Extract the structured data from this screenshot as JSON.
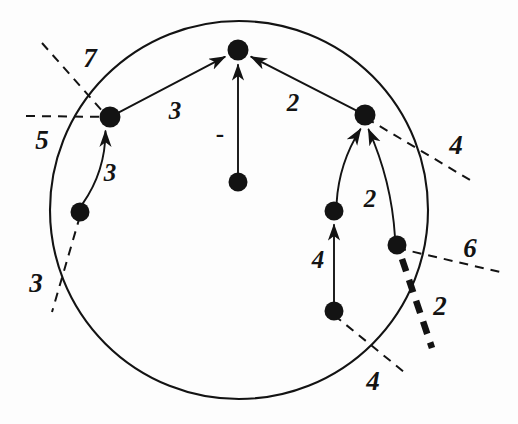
{
  "figure": {
    "type": "graph-diagram",
    "canvas": {
      "width": 518,
      "height": 424,
      "background": "#fdfdfd"
    },
    "ink_color": "#131313"
  },
  "boundary": {
    "shape": "circle",
    "name": "outer-circle",
    "cx": 239,
    "cy": 210,
    "r": 189,
    "stroke": "#131313",
    "stroke_width": 2.1,
    "fill": "none"
  },
  "nodes": [
    {
      "id": "n_top",
      "label": "top-node",
      "x": 238,
      "y": 50,
      "r": 10.5
    },
    {
      "id": "n_center",
      "label": "center-node",
      "x": 238,
      "y": 182,
      "r": 9.5
    },
    {
      "id": "n_left_up",
      "label": "left-upper-node",
      "x": 110,
      "y": 117,
      "r": 10.5
    },
    {
      "id": "n_left_low",
      "label": "left-lower-node",
      "x": 80,
      "y": 212,
      "r": 9.5
    },
    {
      "id": "n_right_up",
      "label": "right-upper-node",
      "x": 365,
      "y": 115,
      "r": 10.5
    },
    {
      "id": "n_right_mid",
      "label": "right-middle-node",
      "x": 334,
      "y": 211,
      "r": 9.5
    },
    {
      "id": "n_right_out",
      "label": "right-outer-node",
      "x": 397,
      "y": 245,
      "r": 9.5
    },
    {
      "id": "n_right_low",
      "label": "right-lower-node",
      "x": 334,
      "y": 311,
      "r": 9.5
    }
  ],
  "edges": [
    {
      "id": "e1",
      "name": "edge-left-upper-to-top",
      "from": "n_left_up",
      "to": "n_top",
      "weight": "3",
      "label_x": 175,
      "label_y": 110,
      "arrow": true,
      "curve": 0
    },
    {
      "id": "e2",
      "name": "edge-right-upper-to-top",
      "from": "n_right_up",
      "to": "n_top",
      "weight": "2",
      "label_x": 293,
      "label_y": 102,
      "arrow": true,
      "curve": 0
    },
    {
      "id": "e3",
      "name": "edge-center-to-top",
      "from": "n_center",
      "to": "n_top",
      "weight": "-",
      "label_x": 220,
      "label_y": 133,
      "arrow": true,
      "curve": 0
    },
    {
      "id": "e4",
      "name": "edge-left-lower-to-left-upper",
      "from": "n_left_low",
      "to": "n_left_up",
      "weight": "3",
      "label_x": 110,
      "label_y": 172,
      "arrow": true,
      "curve": 12
    },
    {
      "id": "e5",
      "name": "edge-right-middle-to-right-upper",
      "from": "n_right_mid",
      "to": "n_right_up",
      "weight": "",
      "label_x": 0,
      "label_y": 0,
      "arrow": true,
      "curve": -10
    },
    {
      "id": "e6",
      "name": "edge-right-outer-to-right-upper",
      "from": "n_right_out",
      "to": "n_right_up",
      "weight": "2",
      "label_x": 370,
      "label_y": 198,
      "arrow": true,
      "curve": 10
    },
    {
      "id": "e7",
      "name": "edge-right-lower-to-right-middle",
      "from": "n_right_low",
      "to": "n_right_mid",
      "weight": "4",
      "label_x": 318,
      "label_y": 259,
      "arrow": true,
      "curve": 0
    }
  ],
  "cut_lines": [
    {
      "id": "c_7",
      "name": "cut-line-7",
      "style": "dashed-thin",
      "x1": 42,
      "y1": 43,
      "x2": 112,
      "y2": 122,
      "weight": "7",
      "label_x": 90,
      "label_y": 58
    },
    {
      "id": "c_5",
      "name": "cut-line-5",
      "style": "dashed-thin",
      "x1": 26,
      "y1": 116,
      "x2": 112,
      "y2": 117,
      "weight": "5",
      "label_x": 42,
      "label_y": 140
    },
    {
      "id": "c_3",
      "name": "cut-line-3",
      "style": "dashed-thin",
      "x1": 80,
      "y1": 216,
      "x2": 52,
      "y2": 312,
      "weight": "3",
      "label_x": 36,
      "label_y": 283
    },
    {
      "id": "c_4_right",
      "name": "cut-line-4-right",
      "style": "dashed-thin",
      "x1": 366,
      "y1": 118,
      "x2": 470,
      "y2": 180,
      "weight": "4",
      "label_x": 456,
      "label_y": 145
    },
    {
      "id": "c_6",
      "name": "cut-line-6",
      "style": "dashed-thin",
      "x1": 397,
      "y1": 248,
      "x2": 500,
      "y2": 272,
      "weight": "6",
      "label_x": 470,
      "label_y": 248
    },
    {
      "id": "c_2_thick",
      "name": "cut-line-2-thick",
      "style": "dashed-thick",
      "x1": 402,
      "y1": 259,
      "x2": 432,
      "y2": 348,
      "weight": "2",
      "label_x": 440,
      "label_y": 306
    },
    {
      "id": "c_4_bottom",
      "name": "cut-line-4-bottom",
      "style": "dashed-thin",
      "x1": 334,
      "y1": 315,
      "x2": 404,
      "y2": 372,
      "weight": "4",
      "label_x": 373,
      "label_y": 381
    }
  ],
  "legend": {
    "edge_weights": [
      "3",
      "2",
      "-",
      "3",
      "2",
      "4"
    ],
    "cut_weights": [
      "7",
      "5",
      "3",
      "4",
      "6",
      "2",
      "4"
    ]
  }
}
